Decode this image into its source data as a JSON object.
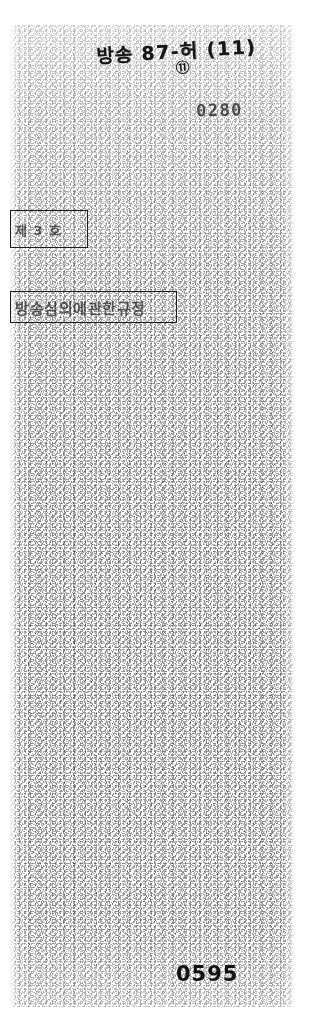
{
  "document": {
    "kind": "scanned-page",
    "condition": "degraded photocopy / microfilm scan, heavy speckle noise, body text illegible"
  },
  "annotations": {
    "handwritten_header": "방송 87-허 (11)",
    "handwritten_circled_mark": "⑪",
    "stamp_number": "0280"
  },
  "boxes": {
    "small_box_text": "제 3 호",
    "title_box_text": "방송심의에관한규정"
  },
  "body": {
    "lines": [
      "",
      "",
      "",
      "",
      "",
      "",
      "",
      "",
      "",
      "",
      "",
      "",
      "",
      "",
      "",
      "",
      "",
      "",
      "",
      "",
      "",
      "",
      "",
      "",
      "",
      "",
      ""
    ]
  },
  "footer": {
    "page_number": "0595",
    "smudge_text": ""
  },
  "colors": {
    "paper": "#ffffff",
    "ink": "#1a1a1a",
    "faded_ink": "#3a3a3a"
  }
}
